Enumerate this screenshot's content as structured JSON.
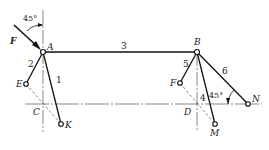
{
  "diagram": {
    "type": "mechanism linkage",
    "force": {
      "label": "F",
      "angle_label": "45°"
    },
    "joints": [
      {
        "label": "A"
      },
      {
        "label": "B"
      },
      {
        "label": "C"
      },
      {
        "label": "D"
      },
      {
        "label": "E"
      },
      {
        "label": "F"
      },
      {
        "label": "K"
      },
      {
        "label": "M"
      },
      {
        "label": "N"
      }
    ],
    "links": [
      {
        "label": "1"
      },
      {
        "label": "2"
      },
      {
        "label": "3"
      },
      {
        "label": "4"
      },
      {
        "label": "5"
      },
      {
        "label": "6"
      }
    ],
    "angle_at_N": "45°"
  }
}
